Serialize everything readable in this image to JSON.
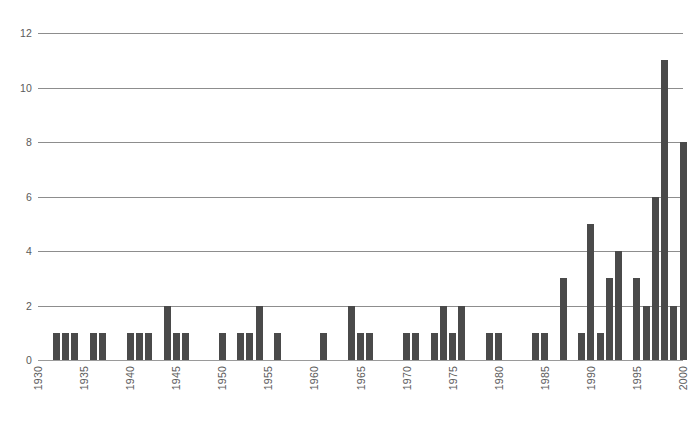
{
  "chart_data": {
    "type": "bar",
    "title": "",
    "subtitle": "",
    "xlabel": "",
    "ylabel": "",
    "xlim": [
      1930,
      2000
    ],
    "ylim": [
      0,
      12
    ],
    "grid": true,
    "legend": null,
    "legend_position": "none",
    "bar_color": "#4a4a4a",
    "gridline_color": "#8d8d8d",
    "axis_text_color": "#5a5a5a",
    "y_ticks": [
      0,
      2,
      4,
      6,
      8,
      10,
      12
    ],
    "y_tick_labels": [
      "0",
      "2",
      "4",
      "6",
      "8",
      "10",
      "12"
    ],
    "x_ticks": [
      1930,
      1935,
      1940,
      1945,
      1950,
      1955,
      1960,
      1965,
      1970,
      1975,
      1980,
      1985,
      1990,
      1995,
      2000
    ],
    "x_tick_labels": [
      "1930",
      "1935",
      "1940",
      "1945",
      "1950",
      "1955",
      "1960",
      "1965",
      "1970",
      "1975",
      "1980",
      "1985",
      "1990",
      "1995",
      "2000"
    ],
    "categories": [
      1930,
      1931,
      1932,
      1933,
      1934,
      1935,
      1936,
      1937,
      1938,
      1939,
      1940,
      1941,
      1942,
      1943,
      1944,
      1945,
      1946,
      1947,
      1948,
      1949,
      1950,
      1951,
      1952,
      1953,
      1954,
      1955,
      1956,
      1957,
      1958,
      1959,
      1960,
      1961,
      1962,
      1963,
      1964,
      1965,
      1966,
      1967,
      1968,
      1969,
      1970,
      1971,
      1972,
      1973,
      1974,
      1975,
      1976,
      1977,
      1978,
      1979,
      1980,
      1981,
      1982,
      1983,
      1984,
      1985,
      1986,
      1987,
      1988,
      1989,
      1990,
      1991,
      1992,
      1993,
      1994,
      1995,
      1996,
      1997,
      1998,
      1999,
      2000
    ],
    "values": [
      0,
      0,
      1,
      1,
      1,
      0,
      1,
      1,
      0,
      0,
      1,
      1,
      0,
      0,
      2,
      1,
      1,
      0,
      0,
      0,
      1,
      0,
      1,
      1,
      2,
      0,
      1,
      0,
      0,
      0,
      0,
      1,
      0,
      0,
      2,
      1,
      1,
      0,
      0,
      0,
      1,
      1,
      0,
      1,
      2,
      1,
      2,
      0,
      0,
      0,
      1,
      1,
      0,
      0,
      0,
      1,
      1,
      0,
      3,
      0,
      1,
      5,
      1,
      3,
      4,
      0,
      3,
      2,
      2,
      6,
      11
    ],
    "bars": [
      {
        "year": 1932,
        "value": 1
      },
      {
        "year": 1933,
        "value": 1
      },
      {
        "year": 1934,
        "value": 1
      },
      {
        "year": 1936,
        "value": 1
      },
      {
        "year": 1937,
        "value": 1
      },
      {
        "year": 1940,
        "value": 1
      },
      {
        "year": 1941,
        "value": 1
      },
      {
        "year": 1942,
        "value": 1
      },
      {
        "year": 1944,
        "value": 2
      },
      {
        "year": 1945,
        "value": 1
      },
      {
        "year": 1946,
        "value": 1
      },
      {
        "year": 1950,
        "value": 1
      },
      {
        "year": 1952,
        "value": 1
      },
      {
        "year": 1953,
        "value": 1
      },
      {
        "year": 1954,
        "value": 2
      },
      {
        "year": 1956,
        "value": 1
      },
      {
        "year": 1961,
        "value": 1
      },
      {
        "year": 1964,
        "value": 2
      },
      {
        "year": 1965,
        "value": 1
      },
      {
        "year": 1966,
        "value": 1
      },
      {
        "year": 1970,
        "value": 1
      },
      {
        "year": 1971,
        "value": 1
      },
      {
        "year": 1973,
        "value": 1
      },
      {
        "year": 1974,
        "value": 2
      },
      {
        "year": 1975,
        "value": 1
      },
      {
        "year": 1976,
        "value": 2
      },
      {
        "year": 1979,
        "value": 1
      },
      {
        "year": 1980,
        "value": 1
      },
      {
        "year": 1984,
        "value": 1
      },
      {
        "year": 1985,
        "value": 1
      },
      {
        "year": 1987,
        "value": 3
      },
      {
        "year": 1989,
        "value": 1
      },
      {
        "year": 1990,
        "value": 5
      },
      {
        "year": 1991,
        "value": 1
      },
      {
        "year": 1992,
        "value": 3
      },
      {
        "year": 1993,
        "value": 4
      },
      {
        "year": 1995,
        "value": 3
      },
      {
        "year": 1996,
        "value": 2
      },
      {
        "year": 1997,
        "value": 6
      },
      {
        "year": 1998,
        "value": 11
      },
      {
        "year": 1999,
        "value": 2
      },
      {
        "year": 2000,
        "value": 8
      }
    ]
  }
}
